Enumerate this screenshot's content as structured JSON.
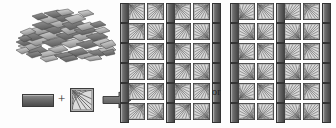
{
  "figure": {
    "background_color": "#fdfdfd"
  },
  "pile": {
    "label": "flake-pile",
    "description": "Loose heap of overlapping flat flake fragments",
    "flake_count": 46,
    "fill_light": "#d6d6d6",
    "fill_mid": "#a8a8a8",
    "fill_dark": "#6d6d6d",
    "stroke": "#4a4a4a"
  },
  "legend": {
    "bar_label": "bar-element",
    "bar_color": "#6f6f6f",
    "plus_symbol": "+",
    "tile_label": "fan-tile-element",
    "tile_color": "#c9c9c9",
    "arrow_symbol": "→",
    "arrow_color": "#6a6a6a"
  },
  "connector": {
    "or_label": "or"
  },
  "chart_data": {
    "type": "table",
    "xlabel": "",
    "ylabel": "",
    "legend_position": "bottom-left",
    "annotations": [
      "or"
    ],
    "arrangements": [
      {
        "name": "arrangement-a",
        "rows": 6,
        "columns": 7,
        "pattern": "bar, tile, tile, bar, tile, tile, bar",
        "row_cells": [
          [
            "bar",
            "tile",
            "tile",
            "bar",
            "tile",
            "tile",
            "bar"
          ],
          [
            "bar",
            "tile",
            "tile",
            "bar",
            "tile",
            "tile",
            "bar"
          ],
          [
            "bar",
            "tile",
            "tile",
            "bar",
            "tile",
            "tile",
            "bar"
          ],
          [
            "bar",
            "tile",
            "tile",
            "bar",
            "tile",
            "tile",
            "bar"
          ],
          [
            "bar",
            "tile",
            "tile",
            "bar",
            "tile",
            "tile",
            "bar"
          ],
          [
            "bar",
            "tile",
            "tile",
            "bar",
            "tile",
            "tile",
            "bar"
          ]
        ],
        "tile_rotations": [
          [
            0,
            90,
            0,
            90
          ],
          [
            90,
            180,
            90,
            180
          ],
          [
            0,
            90,
            0,
            90
          ],
          [
            90,
            180,
            90,
            180
          ],
          [
            0,
            90,
            0,
            90
          ],
          [
            90,
            180,
            90,
            180
          ]
        ]
      },
      {
        "name": "arrangement-b",
        "rows": 6,
        "columns": 7,
        "pattern": "bar, tile, tile, bar, tile, tile, bar",
        "row_cells": [
          [
            "bar",
            "tile",
            "tile",
            "bar",
            "tile",
            "tile",
            "bar"
          ],
          [
            "bar",
            "tile",
            "tile",
            "bar",
            "tile",
            "tile",
            "bar"
          ],
          [
            "bar",
            "tile",
            "tile",
            "bar",
            "tile",
            "tile",
            "bar"
          ],
          [
            "bar",
            "tile",
            "tile",
            "bar",
            "tile",
            "tile",
            "bar"
          ],
          [
            "bar",
            "tile",
            "tile",
            "bar",
            "tile",
            "tile",
            "bar"
          ],
          [
            "bar",
            "tile",
            "tile",
            "bar",
            "tile",
            "tile",
            "bar"
          ]
        ],
        "tile_rotations": [
          [
            270,
            0,
            270,
            0
          ],
          [
            180,
            270,
            180,
            270
          ],
          [
            270,
            0,
            270,
            0
          ],
          [
            180,
            270,
            180,
            270
          ],
          [
            270,
            0,
            270,
            0
          ],
          [
            180,
            270,
            180,
            270
          ]
        ]
      }
    ]
  }
}
